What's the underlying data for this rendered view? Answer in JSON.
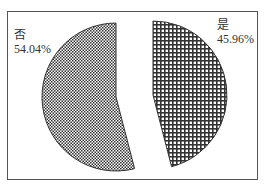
{
  "chart_data": {
    "type": "pie",
    "title": "",
    "exploded": true,
    "slices": [
      {
        "label": "是",
        "value": 45.96,
        "display": "45.96%",
        "pattern": "grid-check"
      },
      {
        "label": "否",
        "value": 54.04,
        "display": "54.04%",
        "pattern": "fine-check"
      }
    ],
    "legend": "none",
    "start_angle": "12 o'clock, clockwise"
  },
  "labels": {
    "yes_name": "是",
    "yes_pct": "45.96%",
    "no_name": "否",
    "no_pct": "54.04%"
  },
  "colors": {
    "frame": "#555555",
    "pattern_dark": "#333333",
    "pattern_light": "#ffffff"
  }
}
